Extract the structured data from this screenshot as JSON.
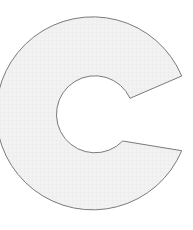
{
  "figure": {
    "shape": "c-shape-annular-sector",
    "colors": {
      "background": "#ffffff",
      "fill": "#f1f1f1",
      "grid": "#e6e6e6",
      "stroke": "#7a7a7a"
    },
    "outer": {
      "cx": 98.5,
      "cy": 114,
      "r": 96.5,
      "cut_upper": [
        181.7,
        76
      ],
      "cut_lower": [
        181.7,
        150.7
      ]
    },
    "inner": {
      "cx": 98.5,
      "cy": 114,
      "r": 38.5,
      "cut_upper": [
        130,
        98.3
      ],
      "cut_lower": [
        122.7,
        141
      ]
    }
  }
}
